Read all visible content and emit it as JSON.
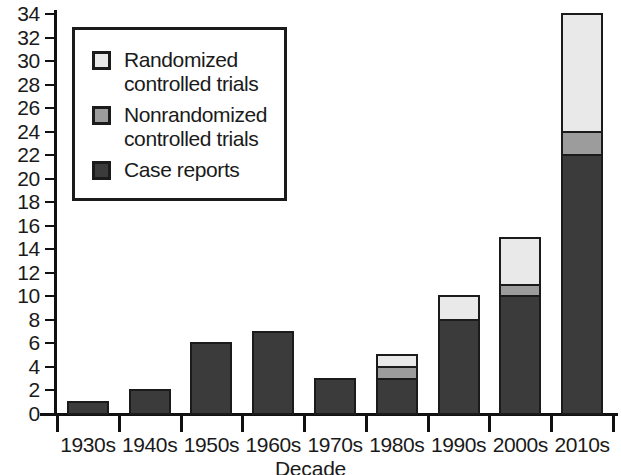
{
  "chart_data": {
    "type": "bar",
    "subtype": "stacked-bar",
    "title": "",
    "xlabel": "Decade",
    "ylabel": "",
    "categories": [
      "1930s",
      "1940s",
      "1950s",
      "1960s",
      "1970s",
      "1980s",
      "1990s",
      "2000s",
      "2010s"
    ],
    "series": [
      {
        "name": "Case reports",
        "color": "#3b3b3b",
        "values": [
          1,
          2,
          6,
          7,
          3,
          3,
          8,
          10,
          22
        ]
      },
      {
        "name": "Nonrandomized controlled trials",
        "color": "#9c9c9c",
        "values": [
          0,
          0,
          0,
          0,
          0,
          1,
          0,
          1,
          2
        ]
      },
      {
        "name": "Randomized controlled trials",
        "color": "#e9e9e9",
        "values": [
          0,
          0,
          0,
          0,
          0,
          1,
          2,
          4,
          10
        ]
      }
    ],
    "totals": [
      1,
      2,
      6,
      7,
      3,
      5,
      10,
      15,
      34
    ],
    "ylim": [
      0,
      34
    ],
    "ytick_step": 2,
    "yticks": [
      0,
      2,
      4,
      6,
      8,
      10,
      12,
      14,
      16,
      18,
      20,
      22,
      24,
      26,
      28,
      30,
      32,
      34
    ],
    "grid": false,
    "legend_position": "upper-left",
    "legend_entries": [
      {
        "label": "Randomized\ncontrolled trials",
        "color": "#e9e9e9"
      },
      {
        "label": "Nonrandomized\ncontrolled trials",
        "color": "#9c9c9c"
      },
      {
        "label": "Case reports",
        "color": "#3b3b3b"
      }
    ]
  },
  "colors": {
    "randomized": "#e9e9e9",
    "nonrandomized": "#9c9c9c",
    "case_reports": "#3b3b3b",
    "axis": "#111111",
    "outline": "#1b1b1b",
    "background": "#ffffff"
  }
}
